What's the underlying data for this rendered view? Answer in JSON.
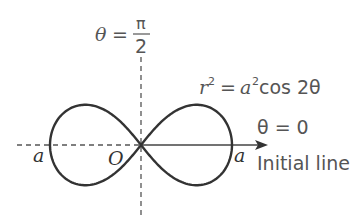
{
  "diagram": {
    "curve": {
      "equation_lhs": "r",
      "equation_lhs_exp": "2",
      "equation_eq": "=",
      "equation_rhs_var": "a",
      "equation_rhs_exp": "2",
      "equation_rhs_fn": "cos 2θ",
      "type": "lemniscate",
      "stroke_color": "#333333"
    },
    "axes": {
      "vertical_label_lhs": "θ",
      "vertical_label_eq": "=",
      "vertical_label_num": "π",
      "vertical_label_den": "2",
      "horizontal_label": "θ = 0",
      "initial_line_label": "Initial line",
      "origin_label": "O",
      "left_intercept_label": "a",
      "right_intercept_label": "a",
      "axis_color": "#444444"
    },
    "geometry": {
      "origin": [
        141,
        145
      ],
      "a_px": 91
    }
  }
}
